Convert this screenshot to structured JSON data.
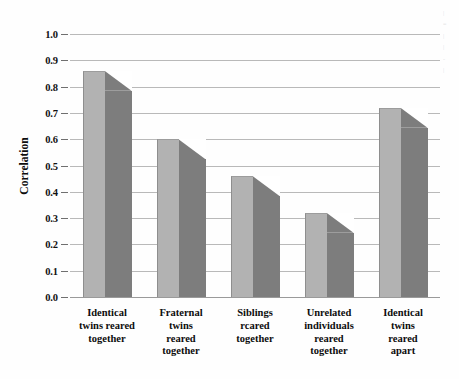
{
  "chart_data": {
    "type": "bar",
    "title": "",
    "subtitle": "",
    "xlabel": "",
    "ylabel": "Correlation",
    "ylim": [
      0.0,
      1.0
    ],
    "ytick_step": 0.1,
    "grid": true,
    "legend": "none",
    "style": "3d-extruded-bars-grayscale",
    "categories": [
      "Identical twins reared together",
      "Fraternal twins reared together",
      "Siblings rcared together",
      "Unrelated individuals reared together",
      "Identical twins reared apart"
    ],
    "category_lines": [
      [
        "Identical",
        "twins reared",
        "together"
      ],
      [
        "Fraternal",
        "twins",
        "reared",
        "together"
      ],
      [
        "Siblings",
        "rcared",
        "together"
      ],
      [
        "Unrelated",
        "individuals",
        "reared",
        "together"
      ],
      [
        "Identical",
        "twins",
        "reared",
        "apart"
      ]
    ],
    "values": [
      0.86,
      0.6,
      0.46,
      0.32,
      0.72
    ],
    "ytick_labels": [
      "1.0",
      "0.9",
      "0.8",
      "0.7",
      "0.6",
      "0.5",
      "0.4",
      "0.3",
      "0.2",
      "0.1",
      "0.0"
    ],
    "ytick_values": [
      1.0,
      0.9,
      0.8,
      0.7,
      0.6,
      0.5,
      0.4,
      0.3,
      0.2,
      0.1,
      0.0
    ],
    "colors": {
      "bar_front": "#b2b2b2",
      "bar_side": "#7d7d7d",
      "gridline": "#b9b9b9",
      "baseline": "#9a9a9a",
      "text": "#0d0d0d",
      "background": "#fefefe"
    }
  },
  "page_edge_caption": {
    "lines": [
      "|",
      "=",
      "|",
      "|",
      "-",
      "|"
    ]
  }
}
